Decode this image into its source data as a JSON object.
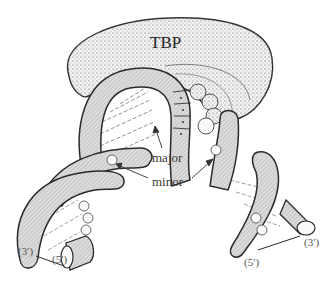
{
  "diagram": {
    "labels": {
      "protein": "TBP",
      "major_groove": "major",
      "minor_groove": "minor",
      "left_strand_end_3": "(3′)",
      "left_strand_end_5": "(5′)",
      "right_strand_end_5": "(5′)",
      "right_strand_end_3": "(3′)"
    },
    "colors": {
      "outline": "#2a2a2a",
      "backbone_fill": "#d9d9d9",
      "protein_fill": "#e6e6e6",
      "background": "#ffffff"
    }
  }
}
